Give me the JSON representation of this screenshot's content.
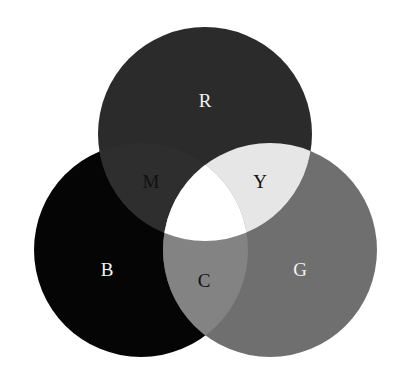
{
  "diagram": {
    "type": "additive-color-venn",
    "circles": {
      "red": {
        "label": "R",
        "cx": 205,
        "cy": 134,
        "r": 107,
        "fill": "#2b2b2b"
      },
      "blue": {
        "label": "B",
        "cx": 141,
        "cy": 250,
        "r": 107,
        "fill": "#050505"
      },
      "green": {
        "label": "G",
        "cx": 270,
        "cy": 250,
        "r": 107,
        "fill": "#6f6f6f"
      }
    },
    "overlaps": {
      "magenta": {
        "label": "M",
        "fill": "#2e2e2e"
      },
      "yellow": {
        "label": "Y",
        "fill": "#e6e6e6"
      },
      "cyan": {
        "label": "C",
        "fill": "#838383"
      },
      "white": {
        "label": "",
        "fill": "#ffffff"
      }
    },
    "labels": {
      "R": {
        "text": "R",
        "x": 205,
        "y": 103,
        "color": "#f2f2f2"
      },
      "M": {
        "text": "M",
        "x": 151,
        "y": 184,
        "color": "#111111"
      },
      "Y": {
        "text": "Y",
        "x": 260,
        "y": 184,
        "color": "#111111"
      },
      "B": {
        "text": "B",
        "x": 107,
        "y": 272,
        "color": "#f2f2f2"
      },
      "C": {
        "text": "C",
        "x": 204,
        "y": 283,
        "color": "#111111"
      },
      "G": {
        "text": "G",
        "x": 300,
        "y": 272,
        "color": "#f2f2f2"
      }
    }
  }
}
